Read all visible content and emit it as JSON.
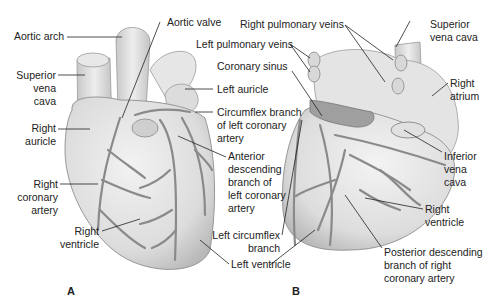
{
  "figure": {
    "panels": [
      {
        "id": "A",
        "label": "A",
        "labels": {
          "aortic_arch": "Aortic arch",
          "aortic_valve": "Aortic valve",
          "superior_vena_cava": "Superior\nvena\ncava",
          "right_auricle": "Right\nauricle",
          "right_coronary_artery": "Right\ncoronary\nartery",
          "right_ventricle": "Right\nventricle",
          "left_auricle": "Left auricle",
          "circumflex_branch": "Circumflex branch\nof left coronary\nartery",
          "anterior_descending": "Anterior\ndescending\nbranch of\nleft coronary\nartery",
          "left_ventricle": "Left ventricle"
        }
      },
      {
        "id": "B",
        "label": "B",
        "labels": {
          "right_pulmonary_veins": "Right pulmonary veins",
          "left_pulmonary_veins": "Left pulmonary veins",
          "coronary_sinus": "Coronary sinus",
          "superior_vena_cava": "Superior\nvena cava",
          "right_atrium": "Right\natrium",
          "inferior_vena_cava": "Inferior\nvena\ncava",
          "right_ventricle": "Right\nventricle",
          "left_circumflex_branch": "Left circumflex\nbranch",
          "posterior_descending": "Posterior descending\nbranch of right\ncoronary artery"
        }
      }
    ]
  }
}
